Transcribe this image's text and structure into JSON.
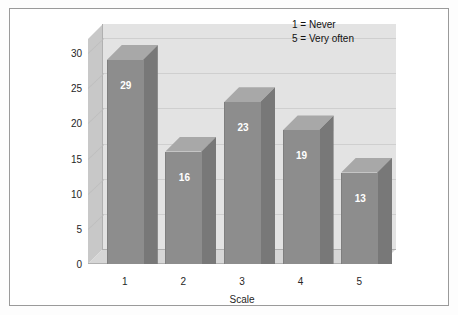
{
  "chart_data": {
    "type": "bar",
    "title": "",
    "xlabel": "Scale",
    "ylabel": "",
    "categories": [
      "1",
      "2",
      "3",
      "4",
      "5"
    ],
    "values": [
      29,
      16,
      23,
      19,
      13
    ],
    "ylim": [
      0,
      32
    ],
    "yticks": [
      0,
      5,
      10,
      15,
      20,
      25,
      30
    ],
    "ytick_labels": [
      "0",
      "5",
      "10",
      "15",
      "20",
      "25",
      "30"
    ],
    "grid": true,
    "legend_position": "top-right",
    "annotations": [
      "1 = Never",
      "5 = Very often"
    ],
    "style": "3d-column",
    "bar_color": "#8d8d8d",
    "wall_color": "#e3e3e3",
    "floor_color": "#d6d6d6"
  },
  "legend": {
    "line1": "1 = Never",
    "line2": "5 = Very often"
  },
  "axes": {
    "x_title": "Scale"
  }
}
